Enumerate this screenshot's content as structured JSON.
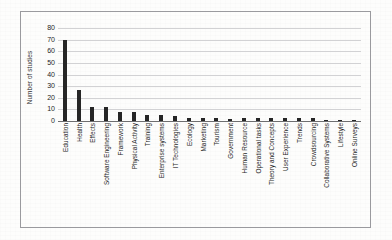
{
  "chart_data": {
    "type": "bar",
    "title": "",
    "subtitle": "",
    "xlabel": "",
    "ylabel": "Number of studies",
    "ylim": [
      0,
      80
    ],
    "ytick_step": 10,
    "yticks": [
      80,
      70,
      60,
      50,
      40,
      30,
      20,
      10,
      0
    ],
    "grid": true,
    "legend": false,
    "legend_position": "none",
    "bar_color": "#262626",
    "gridline_color": "#d2d2d4",
    "axis_color": "#6e6e70",
    "categories": [
      "Education",
      "Health",
      "Effects",
      "Software Engineering",
      "Framework",
      "Physical Activity",
      "Training",
      "Enterprise systems",
      "IT Technologies",
      "Ecology",
      "Marketing",
      "Tourism",
      "Government",
      "Human Resource",
      "Operational tasks",
      "Theory and Concepts",
      "User Experience",
      "Trends",
      "Crowdsourcing",
      "Collaborative Systems",
      "Lifestyle",
      "Online Surveys"
    ],
    "values": [
      70,
      27,
      12,
      12,
      8,
      8,
      5,
      5,
      4,
      3,
      3,
      3,
      2,
      3,
      3,
      3,
      3,
      3,
      3,
      1,
      1,
      1
    ]
  },
  "axes": {
    "y_title": "Number of studies",
    "y_ticks": [
      "80",
      "70",
      "60",
      "50",
      "40",
      "30",
      "20",
      "10",
      "0"
    ]
  }
}
